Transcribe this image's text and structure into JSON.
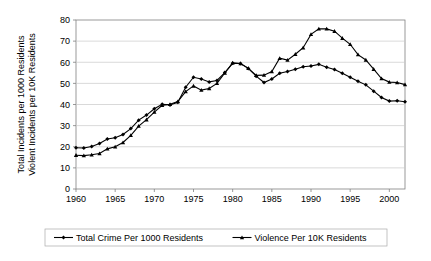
{
  "chart_data": {
    "type": "line",
    "title": "",
    "xlabel": "",
    "ylabel": "Total Incidents per 1000 Residents / Violent Incidents per 10K Residents",
    "ylabel_lines": [
      "Total Incidents per 1000 Residents",
      "Violent Incidents per 10K Residents"
    ],
    "xlim": [
      1960,
      2002
    ],
    "ylim": [
      0,
      80
    ],
    "ytick_values": [
      0,
      10,
      20,
      30,
      40,
      50,
      60,
      70,
      80
    ],
    "ytick_labels": [
      "0",
      "10",
      "20",
      "30",
      "40",
      "50",
      "60",
      "70",
      "80"
    ],
    "xtick_values": [
      1960,
      1965,
      1970,
      1975,
      1980,
      1985,
      1990,
      1995,
      2000
    ],
    "xtick_labels": [
      "1960",
      "1965",
      "1970",
      "1975",
      "1980",
      "1985",
      "1990",
      "1995",
      "2000"
    ],
    "grid": "horizontal",
    "legend_position": "bottom",
    "x": [
      1960,
      1961,
      1962,
      1963,
      1964,
      1965,
      1966,
      1967,
      1968,
      1969,
      1970,
      1971,
      1972,
      1973,
      1974,
      1975,
      1976,
      1977,
      1978,
      1979,
      1980,
      1981,
      1982,
      1983,
      1984,
      1985,
      1986,
      1987,
      1988,
      1989,
      1990,
      1991,
      1992,
      1993,
      1994,
      1995,
      1996,
      1997,
      1998,
      1999,
      2000,
      2001,
      2002
    ],
    "series": [
      {
        "name": "Total Crime Per 1000 Residents",
        "marker": "diamond",
        "color": "#000000",
        "values": [
          19.5,
          19.4,
          20.1,
          21.5,
          23.7,
          24.3,
          25.8,
          28.6,
          32.6,
          35.0,
          38.0,
          40.1,
          39.8,
          41.1,
          48.2,
          52.9,
          52.1,
          50.7,
          51.4,
          55.1,
          59.5,
          59.4,
          57.1,
          53.4,
          50.4,
          52.1,
          54.8,
          55.6,
          56.7,
          57.9,
          58.2,
          59.0,
          57.6,
          56.6,
          54.8,
          52.9,
          51.0,
          49.3,
          46.3,
          43.3,
          41.6,
          41.8,
          41.3
        ]
      },
      {
        "name": "Violence Per 10K Residents",
        "marker": "triangle",
        "color": "#000000",
        "values": [
          16.0,
          15.8,
          16.2,
          16.8,
          19.0,
          20.0,
          22.0,
          25.4,
          29.8,
          32.8,
          36.4,
          39.6,
          40.1,
          41.4,
          46.1,
          48.8,
          46.8,
          47.6,
          50.0,
          54.9,
          59.7,
          59.4,
          57.1,
          53.8,
          53.9,
          55.6,
          61.9,
          61.0,
          63.8,
          66.9,
          73.2,
          75.8,
          75.8,
          74.7,
          71.4,
          68.5,
          63.6,
          61.1,
          56.7,
          52.3,
          50.6,
          50.4,
          49.4
        ]
      }
    ]
  },
  "legend": {
    "items": [
      {
        "label": "Total Crime Per 1000 Residents",
        "marker": "diamond"
      },
      {
        "label": "Violence Per 10K Residents",
        "marker": "triangle"
      }
    ]
  }
}
